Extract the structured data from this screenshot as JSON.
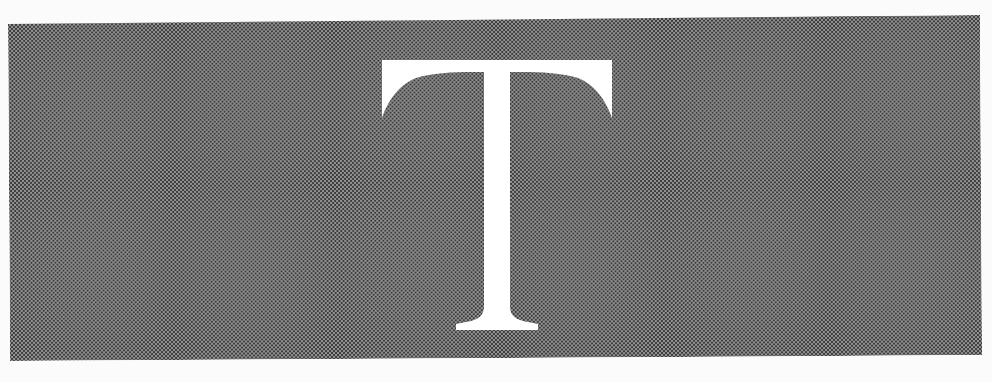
{
  "figure": {
    "letter": "T",
    "style": "white serif capital letter knocked out of a halftone gray panel",
    "colors": {
      "paper": "#fbfbfb",
      "halftone_dot": "#3c3c3c",
      "halftone_base": "#d9d9d9",
      "letter": "#ffffff"
    }
  },
  "bleed_through": {
    "fragment_1": "",
    "fragment_2": ""
  }
}
